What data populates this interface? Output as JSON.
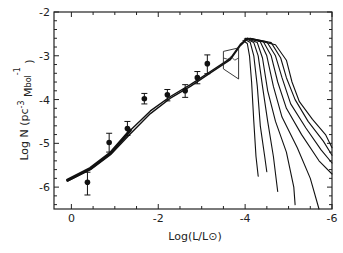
{
  "chart_data": {
    "type": "line",
    "title": "",
    "xlabel": "Log(L/L⊙)",
    "ylabel": "Log N (pc⁻³ M_bol⁻¹)",
    "xlim": [
      0.4,
      -6
    ],
    "ylim": [
      -6.5,
      -2
    ],
    "x_ticks": [
      0,
      -2,
      -4,
      -6
    ],
    "x_tick_labels": [
      "0",
      "-2",
      "-4",
      "-6"
    ],
    "x_minor_step": 0.5,
    "y_ticks": [
      -2,
      -3,
      -4,
      -5,
      -6
    ],
    "y_tick_labels": [
      "-2",
      "-3",
      "-4",
      "-5",
      "-6"
    ],
    "y_minor_step": 0.2,
    "grid": false,
    "legend": null,
    "observed_points": [
      {
        "x": -0.37,
        "y": -5.89,
        "err_low": -6.18,
        "err_high": -5.66
      },
      {
        "x": -0.87,
        "y": -4.98,
        "err_low": -5.2,
        "err_high": -4.77
      },
      {
        "x": -1.29,
        "y": -4.66,
        "err_low": -4.82,
        "err_high": -4.5
      },
      {
        "x": -1.68,
        "y": -3.98,
        "err_low": -4.1,
        "err_high": -3.86
      },
      {
        "x": -2.21,
        "y": -3.89,
        "err_low": -4.03,
        "err_high": -3.77
      },
      {
        "x": -2.62,
        "y": -3.8,
        "err_low": -3.95,
        "err_high": -3.66
      },
      {
        "x": -2.9,
        "y": -3.5,
        "err_low": -3.64,
        "err_high": -3.36
      },
      {
        "x": -3.13,
        "y": -3.18,
        "err_low": -3.41,
        "err_high": -2.98
      }
    ],
    "series": [
      {
        "name": "model-main-upper",
        "points": [
          [
            0.09,
            -5.84
          ],
          [
            -0.44,
            -5.57
          ],
          [
            -0.9,
            -5.22
          ],
          [
            -1.36,
            -4.7
          ],
          [
            -1.82,
            -4.26
          ],
          [
            -2.28,
            -3.93
          ],
          [
            -2.74,
            -3.66
          ],
          [
            -3.2,
            -3.36
          ],
          [
            -3.66,
            -3.06
          ],
          [
            -3.89,
            -2.74
          ],
          [
            -4.05,
            -2.6
          ]
        ]
      },
      {
        "name": "model-main-lower",
        "points": [
          [
            0.09,
            -5.86
          ],
          [
            -0.44,
            -5.6
          ],
          [
            -0.9,
            -5.26
          ],
          [
            -1.36,
            -4.78
          ],
          [
            -1.82,
            -4.32
          ],
          [
            -2.28,
            -3.97
          ],
          [
            -2.74,
            -3.7
          ],
          [
            -3.2,
            -3.39
          ],
          [
            -3.66,
            -3.09
          ],
          [
            -3.89,
            -2.77
          ],
          [
            -4.05,
            -2.62
          ]
        ]
      },
      {
        "name": "cooling-curve-1",
        "points": [
          [
            -3.95,
            -2.65
          ],
          [
            -4.05,
            -2.72
          ],
          [
            -4.1,
            -3.0
          ],
          [
            -4.15,
            -3.6
          ],
          [
            -4.2,
            -4.5
          ],
          [
            -4.25,
            -5.3
          ],
          [
            -4.3,
            -5.75
          ]
        ]
      },
      {
        "name": "cooling-curve-2",
        "points": [
          [
            -3.98,
            -2.62
          ],
          [
            -4.12,
            -2.7
          ],
          [
            -4.2,
            -3.0
          ],
          [
            -4.28,
            -3.7
          ],
          [
            -4.35,
            -4.6
          ],
          [
            -4.45,
            -5.3
          ],
          [
            -4.5,
            -5.65
          ]
        ]
      },
      {
        "name": "cooling-curve-3",
        "points": [
          [
            -4.0,
            -2.6
          ],
          [
            -4.2,
            -2.7
          ],
          [
            -4.3,
            -3.0
          ],
          [
            -4.4,
            -3.7
          ],
          [
            -4.52,
            -4.5
          ],
          [
            -4.65,
            -5.3
          ],
          [
            -4.75,
            -6.1
          ]
        ]
      },
      {
        "name": "cooling-curve-4",
        "points": [
          [
            -4.02,
            -2.6
          ],
          [
            -4.28,
            -2.7
          ],
          [
            -4.4,
            -3.05
          ],
          [
            -4.52,
            -3.8
          ],
          [
            -4.7,
            -4.5
          ],
          [
            -4.95,
            -5.2
          ],
          [
            -5.12,
            -6.0
          ],
          [
            -5.15,
            -6.4
          ]
        ]
      },
      {
        "name": "cooling-curve-5",
        "points": [
          [
            -4.05,
            -2.6
          ],
          [
            -4.35,
            -2.68
          ],
          [
            -4.5,
            -3.0
          ],
          [
            -4.65,
            -3.7
          ],
          [
            -4.85,
            -4.4
          ],
          [
            -5.2,
            -5.1
          ],
          [
            -5.5,
            -5.8
          ],
          [
            -5.7,
            -6.5
          ]
        ]
      },
      {
        "name": "cooling-curve-6",
        "points": [
          [
            -4.07,
            -2.6
          ],
          [
            -4.42,
            -2.68
          ],
          [
            -4.6,
            -3.0
          ],
          [
            -4.75,
            -3.6
          ],
          [
            -4.95,
            -4.2
          ],
          [
            -5.3,
            -4.8
          ],
          [
            -5.7,
            -5.4
          ],
          [
            -6.0,
            -5.7
          ]
        ]
      },
      {
        "name": "cooling-curve-7",
        "points": [
          [
            -4.1,
            -2.6
          ],
          [
            -4.5,
            -2.68
          ],
          [
            -4.7,
            -3.0
          ],
          [
            -4.85,
            -3.5
          ],
          [
            -5.05,
            -4.1
          ],
          [
            -5.4,
            -4.65
          ],
          [
            -5.75,
            -5.15
          ],
          [
            -6.0,
            -5.45
          ]
        ]
      },
      {
        "name": "cooling-curve-8",
        "points": [
          [
            -4.12,
            -2.6
          ],
          [
            -4.6,
            -2.7
          ],
          [
            -4.82,
            -3.05
          ],
          [
            -4.95,
            -3.5
          ],
          [
            -5.15,
            -4.0
          ],
          [
            -5.45,
            -4.5
          ],
          [
            -5.8,
            -4.95
          ],
          [
            -6.0,
            -5.27
          ]
        ]
      },
      {
        "name": "cooling-curve-9",
        "points": [
          [
            -4.15,
            -2.62
          ],
          [
            -4.7,
            -2.75
          ],
          [
            -4.95,
            -3.1
          ],
          [
            -5.08,
            -3.6
          ],
          [
            -5.25,
            -4.05
          ],
          [
            -5.55,
            -4.45
          ],
          [
            -5.85,
            -4.8
          ],
          [
            -6.0,
            -5.1
          ]
        ]
      }
    ],
    "annotation_box": {
      "corners": [
        [
          -3.5,
          -2.9
        ],
        [
          -3.85,
          -2.82
        ],
        [
          -3.85,
          -3.53
        ],
        [
          -3.5,
          -3.3
        ]
      ],
      "inner_wave": [
        [
          -3.5,
          -3.05
        ],
        [
          -3.6,
          -3.08
        ],
        [
          -3.68,
          -3.02
        ],
        [
          -3.76,
          -3.1
        ],
        [
          -3.85,
          -3.05
        ]
      ]
    }
  }
}
